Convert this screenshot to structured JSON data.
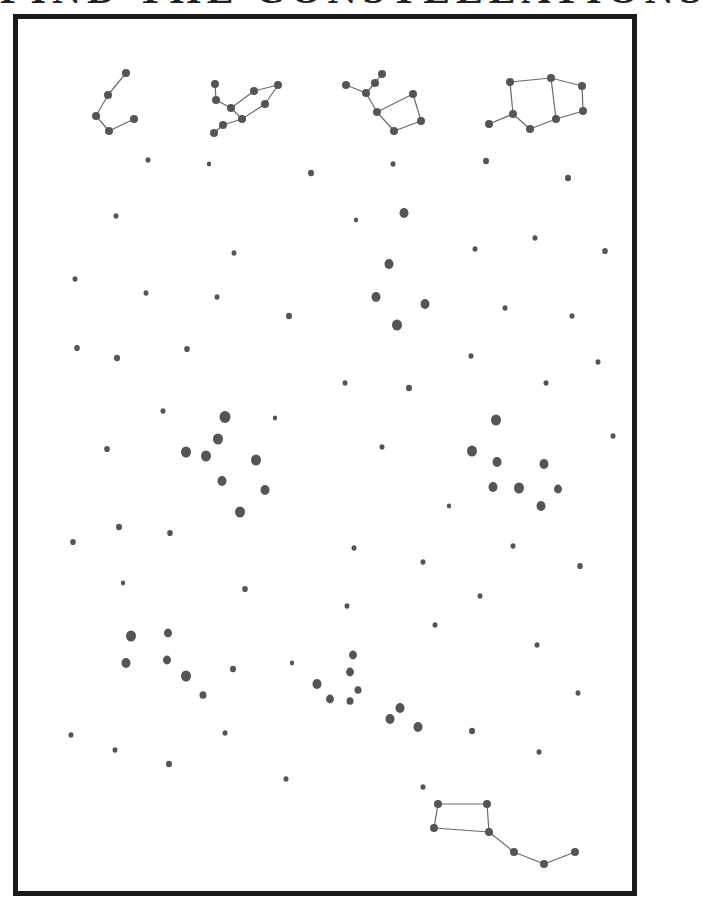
{
  "worksheet": {
    "title": "FIND THE CONSTELLATIONS",
    "colors": {
      "dot": "#555555",
      "line": "#6a6a6a",
      "frame": "#1a1a1a",
      "background": "#ffffff"
    }
  },
  "key_constellations": [
    {
      "name": "constellation-key-1",
      "stars": [
        [
          126,
          73
        ],
        [
          108,
          95
        ],
        [
          96,
          116
        ],
        [
          109,
          131
        ],
        [
          134,
          119
        ]
      ],
      "lines": [
        [
          0,
          1
        ],
        [
          1,
          2
        ],
        [
          2,
          3
        ],
        [
          3,
          4
        ]
      ]
    },
    {
      "name": "constellation-key-2",
      "stars": [
        [
          215,
          84
        ],
        [
          216,
          100
        ],
        [
          231,
          108
        ],
        [
          242,
          119
        ],
        [
          223,
          125
        ],
        [
          214,
          133
        ],
        [
          254,
          91
        ],
        [
          278,
          85
        ],
        [
          265,
          104
        ]
      ],
      "lines": [
        [
          0,
          1
        ],
        [
          1,
          2
        ],
        [
          2,
          3
        ],
        [
          3,
          4
        ],
        [
          4,
          5
        ],
        [
          2,
          6
        ],
        [
          6,
          7
        ],
        [
          7,
          8
        ],
        [
          8,
          3
        ]
      ]
    },
    {
      "name": "constellation-key-3",
      "stars": [
        [
          346,
          85
        ],
        [
          366,
          93
        ],
        [
          375,
          83
        ],
        [
          382,
          74
        ],
        [
          377,
          112
        ],
        [
          394,
          131
        ],
        [
          413,
          94
        ],
        [
          421,
          121
        ]
      ],
      "lines": [
        [
          0,
          1
        ],
        [
          1,
          2
        ],
        [
          2,
          3
        ],
        [
          1,
          4
        ],
        [
          4,
          5
        ],
        [
          4,
          6
        ],
        [
          6,
          7
        ],
        [
          7,
          5
        ]
      ]
    },
    {
      "name": "constellation-key-4",
      "stars": [
        [
          489,
          124
        ],
        [
          513,
          114
        ],
        [
          530,
          129
        ],
        [
          556,
          119
        ],
        [
          583,
          111
        ],
        [
          582,
          86
        ],
        [
          551,
          78
        ],
        [
          510,
          82
        ]
      ],
      "lines": [
        [
          0,
          1
        ],
        [
          1,
          2
        ],
        [
          2,
          3
        ],
        [
          3,
          4
        ],
        [
          4,
          5
        ],
        [
          5,
          6
        ],
        [
          6,
          7
        ],
        [
          7,
          1
        ],
        [
          6,
          3
        ]
      ]
    },
    {
      "name": "constellation-key-5",
      "stars": [
        [
          438,
          804
        ],
        [
          487,
          804
        ],
        [
          434,
          828
        ],
        [
          489,
          832
        ],
        [
          514,
          852
        ],
        [
          544,
          864
        ],
        [
          575,
          852
        ]
      ],
      "lines": [
        [
          0,
          1
        ],
        [
          0,
          2
        ],
        [
          2,
          3
        ],
        [
          1,
          3
        ],
        [
          3,
          4
        ],
        [
          4,
          5
        ],
        [
          5,
          6
        ]
      ]
    }
  ],
  "star_field": [
    [
      148,
      160,
      2.5
    ],
    [
      209,
      164,
      2.2
    ],
    [
      311,
      173,
      3
    ],
    [
      393,
      164,
      2.5
    ],
    [
      486,
      161,
      3
    ],
    [
      568,
      178,
      3
    ],
    [
      116,
      216,
      2.5
    ],
    [
      356,
      220,
      2.2
    ],
    [
      404,
      213,
      4.5
    ],
    [
      234,
      253,
      2.5
    ],
    [
      475,
      249,
      2.5
    ],
    [
      535,
      238,
      2.5
    ],
    [
      605,
      251,
      2.8
    ],
    [
      75,
      279,
      2.5
    ],
    [
      146,
      293,
      2.5
    ],
    [
      217,
      297,
      2.5
    ],
    [
      389,
      264,
      4.5
    ],
    [
      376,
      297,
      4.5
    ],
    [
      425,
      304,
      4.5
    ],
    [
      397,
      325,
      5
    ],
    [
      289,
      316,
      3
    ],
    [
      505,
      308,
      2.5
    ],
    [
      572,
      316,
      2.5
    ],
    [
      77,
      348,
      2.8
    ],
    [
      117,
      358,
      3
    ],
    [
      187,
      349,
      2.8
    ],
    [
      471,
      356,
      2.5
    ],
    [
      598,
      362,
      2.5
    ],
    [
      345,
      383,
      2.5
    ],
    [
      409,
      388,
      3
    ],
    [
      546,
      383,
      2.5
    ],
    [
      163,
      411,
      2.5
    ],
    [
      225,
      417,
      5.5
    ],
    [
      275,
      418,
      2.2
    ],
    [
      218,
      439,
      5
    ],
    [
      107,
      449,
      2.8
    ],
    [
      186,
      452,
      5
    ],
    [
      206,
      456,
      5
    ],
    [
      256,
      460,
      5
    ],
    [
      382,
      447,
      2.5
    ],
    [
      496,
      420,
      5
    ],
    [
      472,
      451,
      5
    ],
    [
      613,
      436,
      2.5
    ],
    [
      222,
      481,
      4.5
    ],
    [
      265,
      490,
      4.5
    ],
    [
      240,
      512,
      5
    ],
    [
      497,
      462,
      4.5
    ],
    [
      544,
      464,
      4.5
    ],
    [
      493,
      487,
      4.5
    ],
    [
      519,
      488,
      5
    ],
    [
      558,
      489,
      4
    ],
    [
      541,
      506,
      4.5
    ],
    [
      119,
      527,
      3
    ],
    [
      170,
      533,
      2.8
    ],
    [
      73,
      542,
      2.8
    ],
    [
      449,
      506,
      2.2
    ],
    [
      354,
      548,
      2.5
    ],
    [
      423,
      562,
      2.5
    ],
    [
      513,
      546,
      2.5
    ],
    [
      580,
      566,
      2.8
    ],
    [
      123,
      583,
      2.2
    ],
    [
      245,
      589,
      2.8
    ],
    [
      480,
      596,
      2.5
    ],
    [
      347,
      606,
      2.5
    ],
    [
      435,
      625,
      2.5
    ],
    [
      131,
      636,
      5
    ],
    [
      168,
      633,
      4
    ],
    [
      126,
      663,
      4.5
    ],
    [
      167,
      660,
      4
    ],
    [
      186,
      676,
      5
    ],
    [
      233,
      669,
      3
    ],
    [
      292,
      663,
      2.2
    ],
    [
      203,
      695,
      3.5
    ],
    [
      353,
      655,
      4
    ],
    [
      350,
      672,
      4
    ],
    [
      317,
      684,
      4.5
    ],
    [
      358,
      690,
      3.5
    ],
    [
      330,
      699,
      4
    ],
    [
      350,
      701,
      3.5
    ],
    [
      400,
      708,
      4.5
    ],
    [
      390,
      719,
      4.5
    ],
    [
      418,
      727,
      4.5
    ],
    [
      537,
      645,
      2.5
    ],
    [
      578,
      693,
      2.5
    ],
    [
      472,
      731,
      3
    ],
    [
      71,
      735,
      2.5
    ],
    [
      115,
      750,
      2.5
    ],
    [
      225,
      733,
      2.5
    ],
    [
      169,
      764,
      3
    ],
    [
      286,
      779,
      2.5
    ],
    [
      539,
      752,
      2.5
    ],
    [
      423,
      787,
      2.5
    ]
  ]
}
